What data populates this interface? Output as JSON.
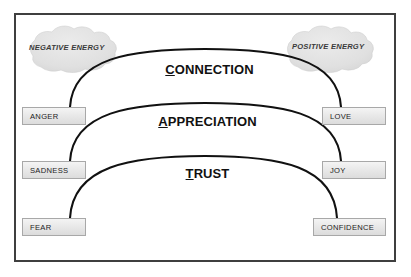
{
  "diagram": {
    "title_acronym": "CAT",
    "frame": {
      "border_color": "#3f3f3f",
      "background": "#ffffff"
    },
    "clouds": [
      {
        "id": "negative",
        "label": "NEGATIVE ENERGY",
        "fill": "#e2e2e2",
        "side": "left"
      },
      {
        "id": "positive",
        "label": "POSITIVE ENERGY",
        "fill": "#e2e2e2",
        "side": "right"
      }
    ],
    "arcs": [
      {
        "id": "connection",
        "first_letter": "C",
        "rest": "ONNECTION",
        "label": "CONNECTION",
        "color": "#111111"
      },
      {
        "id": "appreciation",
        "first_letter": "A",
        "rest": "PPRECIATION",
        "label": "APPRECIATION",
        "color": "#111111"
      },
      {
        "id": "trust",
        "first_letter": "T",
        "rest": "RUST",
        "label": "TRUST",
        "color": "#111111"
      }
    ],
    "left_boxes": [
      {
        "id": "anger",
        "label": "ANGER"
      },
      {
        "id": "sadness",
        "label": "SADNESS"
      },
      {
        "id": "fear",
        "label": "FEAR"
      }
    ],
    "right_boxes": [
      {
        "id": "love",
        "label": "LOVE"
      },
      {
        "id": "joy",
        "label": "JOY"
      },
      {
        "id": "confidence",
        "label": "CONFIDENCE"
      }
    ],
    "colors": {
      "box_border": "#a8a8a8",
      "box_fill_top": "#f4f4f4",
      "box_fill_bottom": "#dcdcdc",
      "text": "#1c1c1c",
      "cloud_text": "#3a3a3a"
    }
  }
}
